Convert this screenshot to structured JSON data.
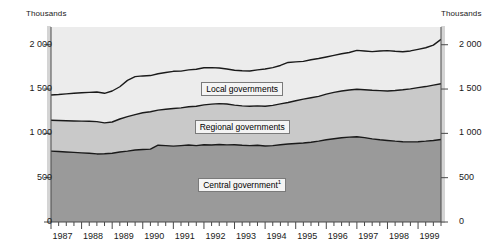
{
  "axis": {
    "unit_left": "Thousands",
    "unit_right": "Thousands",
    "y_ticks": [
      "0",
      "500",
      "1 000",
      "1 500",
      "2 000"
    ],
    "y_tick_values": [
      0,
      500,
      1000,
      1500,
      2000
    ],
    "x_ticks": [
      "1987",
      "1988",
      "1989",
      "1990",
      "1991",
      "1992",
      "1993",
      "1994",
      "1995",
      "1996",
      "1997",
      "1998",
      "1999"
    ]
  },
  "series_labels": {
    "local": "Local governments",
    "regional": "Regional governments",
    "central": "Central government",
    "central_footnote": "1"
  },
  "colors": {
    "local_band": "#ececec",
    "regional_band": "#c9c9c9",
    "central_band": "#9a9a9a",
    "plot_background": "#ececec",
    "line": "#1a1a1a",
    "axis": "#4a4a4a"
  },
  "chart_data": {
    "type": "area",
    "title": "",
    "subtitle": "",
    "xlabel": "",
    "ylabel": "Thousands",
    "ylim": [
      0,
      2200
    ],
    "grid": false,
    "legend_position": "inline-band-labels",
    "stacked": true,
    "note": "Stacked area chart of public employment by level of government, quarterly observations 1987-1999. Values in thousands. Series values are cumulative band tops read off the y axis.",
    "x": [
      "1987Q1",
      "1987Q2",
      "1987Q3",
      "1987Q4",
      "1988Q1",
      "1988Q2",
      "1988Q3",
      "1988Q4",
      "1989Q1",
      "1989Q2",
      "1989Q3",
      "1989Q4",
      "1990Q1",
      "1990Q2",
      "1990Q3",
      "1990Q4",
      "1991Q1",
      "1991Q2",
      "1991Q3",
      "1991Q4",
      "1992Q1",
      "1992Q2",
      "1992Q3",
      "1992Q4",
      "1993Q1",
      "1993Q2",
      "1993Q3",
      "1993Q4",
      "1994Q1",
      "1994Q2",
      "1994Q3",
      "1994Q4",
      "1995Q1",
      "1995Q2",
      "1995Q3",
      "1995Q4",
      "1996Q1",
      "1996Q2",
      "1996Q3",
      "1996Q4",
      "1997Q1",
      "1997Q2",
      "1997Q3",
      "1997Q4",
      "1998Q1",
      "1998Q2",
      "1998Q3",
      "1998Q4",
      "1999Q1",
      "1999Q2",
      "1999Q3",
      "1999Q4"
    ],
    "series": [
      {
        "name": "Central government",
        "color": "#9a9a9a",
        "values": [
          800,
          795,
          790,
          785,
          780,
          775,
          768,
          770,
          775,
          790,
          800,
          812,
          818,
          822,
          866,
          862,
          856,
          862,
          868,
          862,
          872,
          868,
          874,
          870,
          872,
          866,
          862,
          866,
          858,
          862,
          872,
          880,
          886,
          892,
          900,
          912,
          928,
          940,
          950,
          958,
          962,
          952,
          938,
          928,
          920,
          912,
          906,
          904,
          906,
          912,
          920,
          930
        ]
      },
      {
        "name": "Regional governments",
        "color": "#c9c9c9",
        "cumulative_top": [
          1148,
          1145,
          1142,
          1140,
          1138,
          1136,
          1132,
          1118,
          1128,
          1162,
          1188,
          1212,
          1232,
          1244,
          1262,
          1272,
          1280,
          1288,
          1300,
          1306,
          1322,
          1330,
          1336,
          1332,
          1318,
          1310,
          1306,
          1310,
          1306,
          1316,
          1332,
          1348,
          1368,
          1386,
          1402,
          1418,
          1442,
          1462,
          1478,
          1490,
          1498,
          1492,
          1486,
          1482,
          1478,
          1484,
          1492,
          1502,
          1516,
          1528,
          1544,
          1560
        ]
      },
      {
        "name": "Local governments",
        "color": "#ececec",
        "cumulative_top": [
          1432,
          1438,
          1446,
          1452,
          1458,
          1462,
          1466,
          1452,
          1478,
          1526,
          1598,
          1640,
          1648,
          1652,
          1672,
          1686,
          1700,
          1702,
          1716,
          1724,
          1740,
          1742,
          1738,
          1726,
          1712,
          1706,
          1704,
          1716,
          1726,
          1742,
          1766,
          1800,
          1806,
          1812,
          1830,
          1844,
          1862,
          1880,
          1898,
          1912,
          1936,
          1930,
          1922,
          1930,
          1934,
          1926,
          1920,
          1930,
          1948,
          1966,
          1996,
          2060
        ]
      }
    ]
  }
}
